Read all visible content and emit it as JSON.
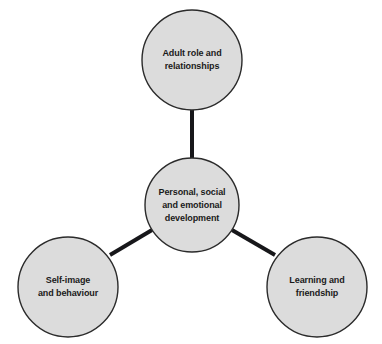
{
  "diagram": {
    "type": "hub-and-spoke",
    "title": "Personal, social and emotional development",
    "background_color": "#ffffff",
    "node_fill_color": "#dcdcdc",
    "node_border_color": "#2b2b2b",
    "connector_color": "#17171a",
    "text_color": "#1a1a1a",
    "nodes": [
      {
        "id": "hub",
        "role": "hub",
        "label": "Personal, social\nand emotional\ndevelopment",
        "label_lines": [
          "Personal, social",
          "and emotional",
          "development"
        ],
        "cx": 192,
        "cy": 205,
        "r": 47
      },
      {
        "id": "adult-role",
        "role": "spoke",
        "label": "Adult role and\nrelationships",
        "label_lines": [
          "Adult role and",
          "relationships"
        ],
        "cx": 192,
        "cy": 60,
        "r": 50
      },
      {
        "id": "self-image",
        "role": "spoke",
        "label": "Self-image\nand behaviour",
        "label_lines": [
          "Self-image",
          "and behaviour"
        ],
        "cx": 68,
        "cy": 287,
        "r": 50
      },
      {
        "id": "learning",
        "role": "spoke",
        "label": "Learning and\nfriendship",
        "label_lines": [
          "Learning and",
          "friendship"
        ],
        "cx": 317,
        "cy": 287,
        "r": 50
      }
    ],
    "connectors": [
      {
        "id": "hub-to-adult-role",
        "from": "hub",
        "to": "adult-role",
        "x1": 192,
        "y1": 158,
        "x2": 192,
        "y2": 110,
        "width": 4
      },
      {
        "id": "hub-to-self-image",
        "from": "hub",
        "to": "self-image",
        "x1": 152,
        "y1": 230,
        "x2": 110,
        "y2": 255,
        "width": 4
      },
      {
        "id": "hub-to-learning",
        "from": "hub",
        "to": "learning",
        "x1": 232,
        "y1": 230,
        "x2": 275,
        "y2": 255,
        "width": 4
      }
    ]
  }
}
